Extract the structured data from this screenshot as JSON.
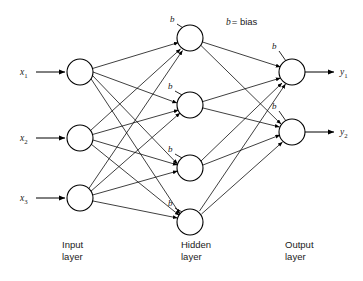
{
  "diagram": {
    "legend": {
      "symbol": "b",
      "text": "= bias"
    },
    "layers": [
      {
        "id": "input",
        "label_line1": "Input",
        "label_line2": "layer",
        "label_x": 62,
        "label_y": 248,
        "node_x": 80,
        "nodes": [
          {
            "name": "input-node-1",
            "label": "x",
            "sub": "1",
            "cy": 72
          },
          {
            "name": "input-node-2",
            "label": "x",
            "sub": "2",
            "cy": 138
          },
          {
            "name": "input-node-3",
            "label": "x",
            "sub": "3",
            "cy": 198
          }
        ]
      },
      {
        "id": "hidden",
        "label_line1": "Hidden",
        "label_line2": "layer",
        "label_x": 181,
        "label_y": 248,
        "node_x": 190,
        "nodes": [
          {
            "name": "hidden-node-1",
            "bias": "b",
            "cy": 38
          },
          {
            "name": "hidden-node-2",
            "bias": "b",
            "cy": 105
          },
          {
            "name": "hidden-node-3",
            "bias": "b",
            "cy": 168
          },
          {
            "name": "hidden-node-4",
            "bias": "b",
            "cy": 222
          }
        ]
      },
      {
        "id": "output",
        "label_line1": "Output",
        "label_line2": "layer",
        "label_x": 285,
        "label_y": 248,
        "node_x": 292,
        "nodes": [
          {
            "name": "output-node-1",
            "bias": "b",
            "label": "y",
            "sub": "1",
            "cy": 72
          },
          {
            "name": "output-node-2",
            "bias": "b",
            "label": "y",
            "sub": "2",
            "cy": 132
          }
        ]
      }
    ],
    "node_radius": 13,
    "colors": {
      "stroke": "#000000",
      "text": "#1a1a1a",
      "node_fill": "#ffffff",
      "background": "#ffffff"
    },
    "input_labels": [
      {
        "text": "x",
        "sub": "1",
        "x": 20,
        "y": 75
      },
      {
        "text": "x",
        "sub": "2",
        "x": 20,
        "y": 141
      },
      {
        "text": "x",
        "sub": "3",
        "x": 20,
        "y": 201
      }
    ],
    "output_labels": [
      {
        "text": "y",
        "sub": "1",
        "x": 340,
        "y": 75
      },
      {
        "text": "y",
        "sub": "2",
        "x": 340,
        "y": 135
      }
    ],
    "bias_labels": [
      {
        "name": "bias-label-hidden-1",
        "text": "b",
        "x": 170,
        "y": 22
      },
      {
        "name": "bias-label-hidden-2",
        "text": "b",
        "x": 168,
        "y": 89
      },
      {
        "name": "bias-label-hidden-3",
        "text": "b",
        "x": 168,
        "y": 152
      },
      {
        "name": "bias-label-hidden-4",
        "text": "b",
        "x": 168,
        "y": 206
      },
      {
        "name": "bias-label-output-1",
        "text": "b",
        "x": 272,
        "y": 49
      },
      {
        "name": "bias-label-output-2",
        "text": "b",
        "x": 272,
        "y": 109
      }
    ],
    "legend_pos": {
      "x": 226,
      "y": 25
    }
  }
}
